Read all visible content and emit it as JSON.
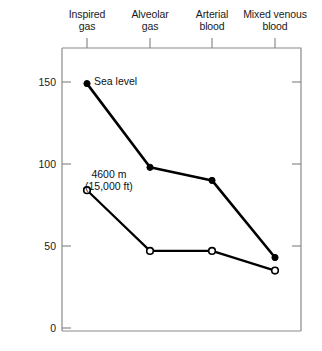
{
  "chart_data": {
    "type": "line",
    "title": "",
    "xlabel": "",
    "ylabel": "P O2 (mm Hg)",
    "ylabel_base": "P",
    "ylabel_sub": "O",
    "ylabel_sub2": "2",
    "ylabel_unit": " (mm Hg)",
    "categories": [
      "Inspired\ngas",
      "Alveolar\ngas",
      "Arterial\nblood",
      "Mixed venous\nblood"
    ],
    "categories_flat": [
      "Inspired gas",
      "Alveolar gas",
      "Arterial blood",
      "Mixed venous blood"
    ],
    "yticks": [
      "0",
      "50",
      "100",
      "150"
    ],
    "ytick_values": [
      0,
      50,
      100,
      150
    ],
    "ylim": [
      0,
      160
    ],
    "grid": "off",
    "legend": "in-plot annotations",
    "series": [
      {
        "name": "Sea level",
        "marker": "filled-circle",
        "color": "#000000",
        "values": [
          149,
          98,
          90,
          43
        ]
      },
      {
        "name": "4600 m (15,000 ft)",
        "marker": "open-circle",
        "color": "#000000",
        "values": [
          84,
          47,
          47,
          35
        ]
      }
    ],
    "annotations": [
      {
        "id": "sea-level",
        "text": "Sea level"
      },
      {
        "id": "altitude",
        "text": "4600 m\n(15,000 ft)"
      }
    ]
  },
  "colors": {
    "line": "#000000",
    "axis": "#7b7b7b",
    "text": "#1a1a1a",
    "background": "#ffffff"
  }
}
